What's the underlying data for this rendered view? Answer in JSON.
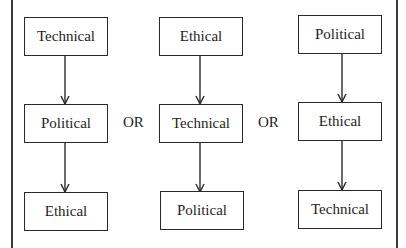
{
  "diagram": {
    "separator": "OR",
    "sequences": [
      {
        "id": "sequence-1",
        "steps": [
          "Technical",
          "Political",
          "Ethical"
        ]
      },
      {
        "id": "sequence-2",
        "steps": [
          "Ethical",
          "Technical",
          "Political"
        ]
      },
      {
        "id": "sequence-3",
        "steps": [
          "Political",
          "Ethical",
          "Technical"
        ]
      }
    ],
    "colors": {
      "stroke": "#2a2a2a",
      "text": "#1e1e1e",
      "background": "#ffffff"
    }
  }
}
